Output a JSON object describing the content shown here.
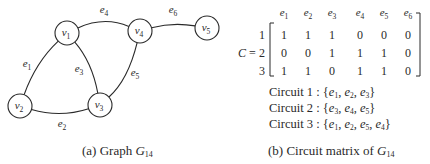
{
  "graph": {
    "name": "G",
    "name_subscript": "14",
    "caption_prefix": "(a) Graph ",
    "vertices": [
      {
        "id": "v1",
        "base": "v",
        "sub": "1"
      },
      {
        "id": "v2",
        "base": "v",
        "sub": "2"
      },
      {
        "id": "v3",
        "base": "v",
        "sub": "3"
      },
      {
        "id": "v4",
        "base": "v",
        "sub": "4"
      },
      {
        "id": "v5",
        "base": "v",
        "sub": "5"
      }
    ],
    "edges": [
      {
        "id": "e1",
        "base": "e",
        "sub": "1",
        "from": "v1",
        "to": "v2"
      },
      {
        "id": "e2",
        "base": "e",
        "sub": "2",
        "from": "v2",
        "to": "v3"
      },
      {
        "id": "e3",
        "base": "e",
        "sub": "3",
        "from": "v1",
        "to": "v3"
      },
      {
        "id": "e4",
        "base": "e",
        "sub": "4",
        "from": "v1",
        "to": "v4"
      },
      {
        "id": "e5",
        "base": "e",
        "sub": "5",
        "from": "v4",
        "to": "v3"
      },
      {
        "id": "e6",
        "base": "e",
        "sub": "6",
        "from": "v4",
        "to": "v5"
      }
    ]
  },
  "matrix": {
    "symbol": "C",
    "equals": "=",
    "column_headers": [
      {
        "base": "e",
        "sub": "1"
      },
      {
        "base": "e",
        "sub": "2"
      },
      {
        "base": "e",
        "sub": "3"
      },
      {
        "base": "e",
        "sub": "4"
      },
      {
        "base": "e",
        "sub": "5"
      },
      {
        "base": "e",
        "sub": "6"
      }
    ],
    "row_labels": [
      "1",
      "2",
      "3"
    ],
    "rows": [
      [
        "1",
        "1",
        "1",
        "0",
        "0",
        "0"
      ],
      [
        "0",
        "0",
        "1",
        "1",
        "1",
        "0"
      ],
      [
        "1",
        "1",
        "0",
        "1",
        "1",
        "0"
      ]
    ],
    "caption_prefix": "(b) Circuit matrix of ",
    "caption_name": "G",
    "caption_subscript": "14"
  },
  "circuits": [
    {
      "label": "Circuit 1",
      "separator": " : ",
      "edges": [
        {
          "base": "e",
          "sub": "1"
        },
        {
          "base": "e",
          "sub": "2"
        },
        {
          "base": "e",
          "sub": "3"
        }
      ]
    },
    {
      "label": "Circuit 2",
      "separator": " : ",
      "edges": [
        {
          "base": "e",
          "sub": "3"
        },
        {
          "base": "e",
          "sub": "4"
        },
        {
          "base": "e",
          "sub": "5"
        }
      ]
    },
    {
      "label": "Circuit 3",
      "separator": " : ",
      "edges": [
        {
          "base": "e",
          "sub": "1"
        },
        {
          "base": "e",
          "sub": "2"
        },
        {
          "base": "e",
          "sub": "5"
        },
        {
          "base": "e",
          "sub": "4"
        }
      ]
    }
  ],
  "colors": {
    "ink": "#2a2a2a",
    "background": "#ffffff"
  }
}
